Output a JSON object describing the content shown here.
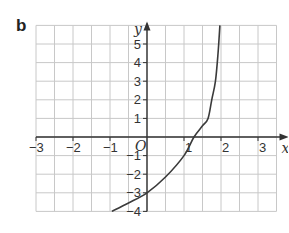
{
  "panel_label": "b",
  "chart_data": {
    "type": "line",
    "title": "",
    "xlabel": "x",
    "ylabel": "y",
    "origin_label": "O",
    "xlim": [
      -3,
      3.5
    ],
    "ylim": [
      -4,
      6
    ],
    "grid": true,
    "grid_x_step": 0.5,
    "grid_y_step": 1,
    "x_ticks": [
      -3,
      -2,
      -1,
      1,
      2,
      3
    ],
    "x_tick_labels": [
      "−3",
      "−2",
      "−1",
      "1",
      "2",
      "3"
    ],
    "y_ticks": [
      5,
      4,
      3,
      2,
      1,
      -1,
      -2,
      -3,
      -4
    ],
    "y_tick_labels": [
      "5",
      "4",
      "3",
      "2",
      "1",
      "−1",
      "−2",
      "−3",
      "−4"
    ],
    "series": [
      {
        "name": "curve",
        "color": "#3a3a3a",
        "x": [
          -0.95,
          -0.5,
          0,
          0.5,
          1,
          1.27,
          1.5,
          1.65,
          1.75,
          1.85,
          1.92,
          1.97
        ],
        "y": [
          -4,
          -3.55,
          -3.0,
          -2.15,
          -1.0,
          0,
          0.6,
          1.0,
          2.0,
          3.0,
          4.5,
          6
        ]
      }
    ],
    "vertical_asymptote_x": 2
  }
}
